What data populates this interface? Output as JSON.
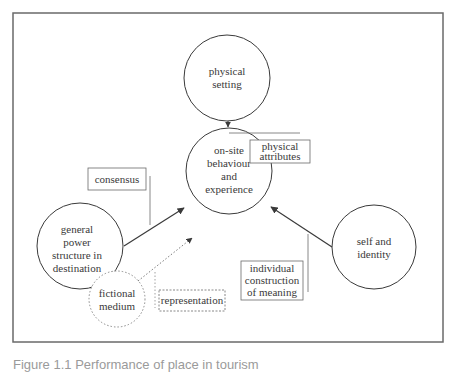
{
  "diagram": {
    "nodes": {
      "physical_setting": {
        "line1": "physical",
        "line2": "setting"
      },
      "center": {
        "line1": "on-site",
        "line2": "behaviour",
        "line3": "and",
        "line4": "experience"
      },
      "power": {
        "line1": "general",
        "line2": "power",
        "line3": "structure in",
        "line4": "destination"
      },
      "self": {
        "line1": "self and",
        "line2": "identity"
      },
      "fictional": {
        "line1": "fictional",
        "line2": "medium"
      }
    },
    "labels": {
      "consensus": "consensus",
      "physical_attributes": {
        "line1": "physical",
        "line2": "attributes"
      },
      "representation": "representation",
      "individual": {
        "line1": "individual",
        "line2": "construction",
        "line3": "of meaning"
      }
    },
    "edges": [
      {
        "from": "physical setting",
        "to": "on-site behaviour and experience",
        "style": "solid",
        "label": "physical attributes"
      },
      {
        "from": "general power structure in destination",
        "to": "on-site behaviour and experience",
        "style": "solid",
        "label": "consensus"
      },
      {
        "from": "fictional medium",
        "to": "on-site behaviour and experience",
        "style": "dotted",
        "label": "representation"
      },
      {
        "from": "self and identity",
        "to": "on-site behaviour and experience",
        "style": "solid",
        "label": "individual construction of meaning"
      }
    ],
    "colors": {
      "stroke": "#3a3a3a",
      "frame": "#6a6a6a",
      "dotted": "#8a8a8a"
    }
  },
  "caption": "Figure 1.1 Performance of place in tourism"
}
